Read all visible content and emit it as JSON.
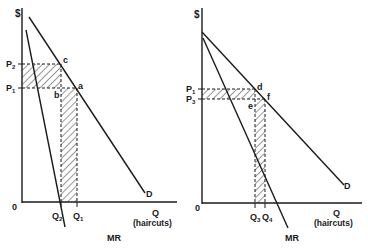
{
  "figure": {
    "left_panel": {
      "y_axis_label": "$",
      "origin_label": "0",
      "x_axis_label": "Q",
      "x_axis_unit": "(haircuts)",
      "demand_label": "D",
      "mr_label": "MR",
      "price_labels": [
        {
          "main": "P",
          "sub": "2"
        },
        {
          "main": "P",
          "sub": "1"
        }
      ],
      "quantity_labels": [
        {
          "main": "Q",
          "sub": "2"
        },
        {
          "main": "Q",
          "sub": "1"
        }
      ],
      "point_labels": {
        "c": "c",
        "a": "a",
        "b": "b"
      }
    },
    "right_panel": {
      "y_axis_label": "$",
      "origin_label": "0",
      "x_axis_label": "Q",
      "x_axis_unit": "(haircuts)",
      "demand_label": "D",
      "mr_label": "MR",
      "price_labels": [
        {
          "main": "P",
          "sub": "1"
        },
        {
          "main": "P",
          "sub": "3"
        }
      ],
      "quantity_labels": [
        {
          "main": "Q",
          "sub": "3"
        },
        {
          "main": "Q",
          "sub": "4"
        }
      ],
      "point_labels": {
        "d": "d",
        "f": "f",
        "e": "e"
      }
    },
    "colors": {
      "line": "#1a1a1a",
      "background": "#ffffff"
    }
  }
}
